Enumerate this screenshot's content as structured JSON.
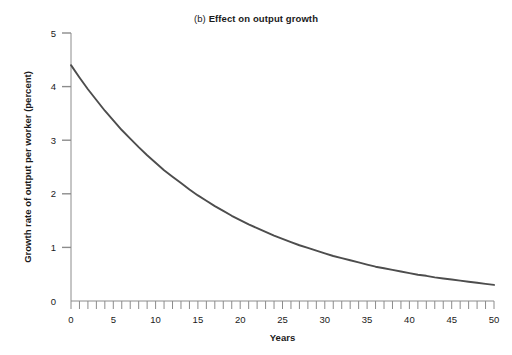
{
  "chart_title": {
    "panel_tag": "(b)",
    "main": "Effect on output growth"
  },
  "chart_data": {
    "type": "line",
    "title": "(b) Effect on output growth",
    "xlabel": "Years",
    "ylabel": "Growth rate of output per worker (percent)",
    "xlim": [
      0,
      50
    ],
    "ylim": [
      0,
      5
    ],
    "grid": false,
    "legend": null,
    "x_ticks": [
      0,
      5,
      10,
      15,
      20,
      25,
      30,
      35,
      40,
      45,
      50
    ],
    "x_tick_labels": [
      "0",
      "5",
      "10",
      "15",
      "20",
      "25",
      "30",
      "35",
      "40",
      "45",
      "50"
    ],
    "x_minor_tick_step": 1,
    "y_ticks": [
      0,
      1,
      2,
      3,
      4,
      5
    ],
    "y_tick_labels": [
      "0",
      "1",
      "2",
      "3",
      "4",
      "5"
    ],
    "series": [
      {
        "name": "Growth rate of output per worker",
        "color": "#4d4d4d",
        "x": [
          0,
          1,
          2,
          3,
          4,
          5,
          6,
          7,
          8,
          9,
          10,
          11,
          12,
          13,
          14,
          15,
          16,
          17,
          18,
          19,
          20,
          21,
          22,
          23,
          24,
          25,
          26,
          27,
          28,
          29,
          30,
          31,
          32,
          33,
          34,
          35,
          36,
          37,
          38,
          39,
          40,
          41,
          42,
          43,
          44,
          45,
          46,
          47,
          48,
          49,
          50
        ],
        "y": [
          4.4,
          4.17,
          3.95,
          3.75,
          3.55,
          3.37,
          3.19,
          3.03,
          2.87,
          2.72,
          2.58,
          2.44,
          2.32,
          2.2,
          2.08,
          1.97,
          1.87,
          1.77,
          1.68,
          1.59,
          1.51,
          1.43,
          1.36,
          1.29,
          1.22,
          1.16,
          1.1,
          1.04,
          0.99,
          0.94,
          0.89,
          0.84,
          0.8,
          0.76,
          0.72,
          0.68,
          0.64,
          0.61,
          0.58,
          0.55,
          0.52,
          0.49,
          0.47,
          0.44,
          0.42,
          0.4,
          0.38,
          0.36,
          0.34,
          0.32,
          0.3
        ]
      }
    ]
  },
  "colors": {
    "curve": "#4d4d4d",
    "axis": "#8c8c8c",
    "text": "#1a1a1a",
    "background": "#ffffff"
  }
}
